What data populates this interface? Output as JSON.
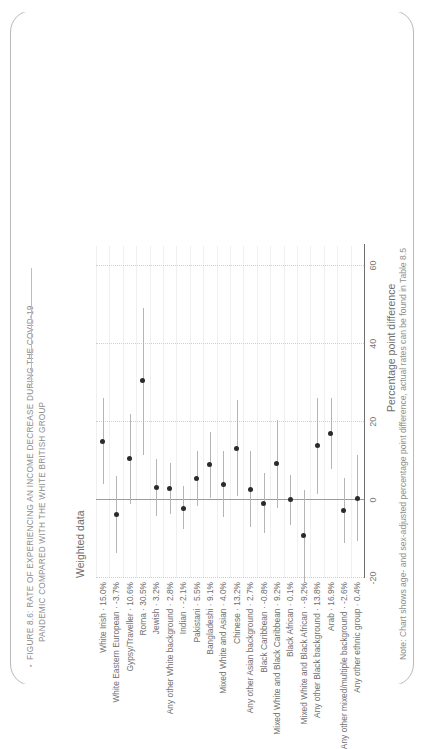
{
  "figure": {
    "title_line1": "FIGURE 8.6: RATE OF EXPERIENCING AN INCOME DECREASE DURING THE COVID-19",
    "title_line2": "PANDEMIC COMPARED WITH THE WHITE BRITISH GROUP",
    "title_bullet": "▪",
    "subtitle": "Weighted data",
    "note": "Note: Chart shows age- and sex-adjusted percentage point difference, actual rates can be found in Table 8.5",
    "accent_color": "#2b2b2b",
    "grid_color": "#cfcfcf",
    "whisker_color": "#b5b5b5"
  },
  "chart_data": {
    "type": "scatter",
    "title": "FIGURE 8.6: RATE OF EXPERIENCING AN INCOME DECREASE DURING THE COVID-19 PANDEMIC COMPARED WITH THE WHITE BRITISH GROUP",
    "subtitle": "Weighted data",
    "xlabel": "Percentage point difference",
    "ylabel": "",
    "xlim": [
      -20,
      65
    ],
    "xticks": [
      -20,
      0,
      20,
      40,
      60
    ],
    "xtick_labels": [
      "-20",
      "0",
      "20",
      "40",
      "60"
    ],
    "grid": true,
    "legend": "none",
    "orientation": "horizontal",
    "reference_line": 0,
    "categories": [
      "White Irish",
      "White Eastern European",
      "Gypsy/Traveller",
      "Roma",
      "Jewish",
      "Any other White background",
      "Indian",
      "Pakistani",
      "Bangladeshi",
      "Mixed White and Asian",
      "Chinese",
      "Any other Asian background",
      "Black Caribbean",
      "Mixed White and Black Caribbean",
      "Black African",
      "Mixed White and Black African",
      "Any other Black background",
      "Arab",
      "Any other mixed/multiple background",
      "Any other ethnic group"
    ],
    "tick_labels": [
      "White Irish · 15.0%",
      "White Eastern European · -3.7%",
      "Gypsy/Traveller · 10.6%",
      "Roma · 30.5%",
      "Jewish · 3.2%",
      "Any other White background · 2.8%",
      "Indian · -2.1%",
      "Pakistani · 5.5%",
      "Bangladeshi · 9.1%",
      "Mixed White and Asian · 4.0%",
      "Chinese · 13.2%",
      "Any other Asian background · 2.7%",
      "Black Caribbean · -0.8%",
      "Mixed White and Black Caribbean · 9.2%",
      "Black African · 0.1%",
      "Mixed White and Black African · -9.2%",
      "Any other Black background · 13.8%",
      "Arab · 16.9%",
      "Any other mixed/multiple background · -2.6%",
      "Any other ethnic group · 0.4%"
    ],
    "values": [
      15.0,
      -3.7,
      10.6,
      30.5,
      3.2,
      2.8,
      -2.1,
      5.5,
      9.1,
      4.0,
      13.2,
      2.7,
      -0.8,
      9.2,
      0.1,
      -9.2,
      13.8,
      16.9,
      -2.6,
      0.4
    ],
    "ci_low": [
      4.0,
      -13.5,
      -1.0,
      11.5,
      -4.0,
      -3.5,
      -7.5,
      -1.5,
      0.5,
      -4.5,
      1.0,
      -7.0,
      -8.5,
      -2.0,
      -6.5,
      -21.0,
      1.5,
      8.0,
      -11.0,
      -10.5
    ],
    "ci_high": [
      26.0,
      6.0,
      22.0,
      49.0,
      10.5,
      9.5,
      3.5,
      12.5,
      17.5,
      12.5,
      25.5,
      12.5,
      7.0,
      20.5,
      6.5,
      2.5,
      26.0,
      26.0,
      5.5,
      11.5
    ]
  }
}
